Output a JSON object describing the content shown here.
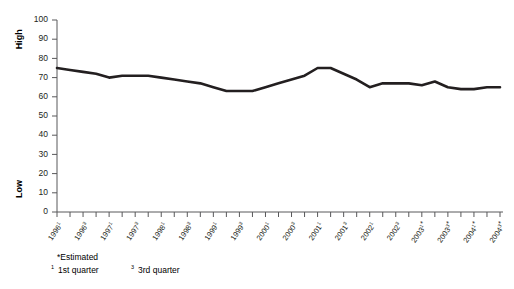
{
  "chart_data": {
    "type": "line",
    "title": "",
    "xlabel": "",
    "ylabel": "",
    "ylim": [
      0,
      100
    ],
    "ytick_step": 10,
    "grid": false,
    "legend": "none",
    "y_axis_annotations": [
      {
        "text": "High",
        "value": 90
      },
      {
        "text": "Low",
        "value": 12
      }
    ],
    "ytick_labels": [
      "100",
      "90",
      "80",
      "70",
      "60",
      "50",
      "40",
      "30",
      "20",
      "10",
      "0"
    ],
    "ytick_values": [
      100,
      90,
      80,
      70,
      60,
      50,
      40,
      30,
      20,
      10,
      0
    ],
    "categories": [
      "1996¹",
      "1996²",
      "1996³",
      "1996⁴",
      "1997¹",
      "1997²",
      "1997³",
      "1997⁴",
      "1998¹",
      "1998²",
      "1998³",
      "1998⁴",
      "1999¹",
      "1999²",
      "1999³",
      "1999⁴",
      "2000¹",
      "2000²",
      "2000³",
      "2000⁴",
      "2001¹",
      "2001²",
      "2001³",
      "2001⁴",
      "2002¹",
      "2002²",
      "2002³",
      "2002⁴",
      "2003¹*",
      "2003²*",
      "2003³*",
      "2003⁴*",
      "2004¹*",
      "2004²*",
      "2004³*"
    ],
    "xtick_labels": [
      {
        "index": 0,
        "year": "1996",
        "sup": "1",
        "est": ""
      },
      {
        "index": 2,
        "year": "1996",
        "sup": "3",
        "est": ""
      },
      {
        "index": 4,
        "year": "1997",
        "sup": "1",
        "est": ""
      },
      {
        "index": 6,
        "year": "1997",
        "sup": "3",
        "est": ""
      },
      {
        "index": 8,
        "year": "1998",
        "sup": "1",
        "est": ""
      },
      {
        "index": 10,
        "year": "1998",
        "sup": "3",
        "est": ""
      },
      {
        "index": 12,
        "year": "1999",
        "sup": "1",
        "est": ""
      },
      {
        "index": 14,
        "year": "1999",
        "sup": "3",
        "est": ""
      },
      {
        "index": 16,
        "year": "2000",
        "sup": "1",
        "est": ""
      },
      {
        "index": 18,
        "year": "2000",
        "sup": "3",
        "est": ""
      },
      {
        "index": 20,
        "year": "2001",
        "sup": "1",
        "est": ""
      },
      {
        "index": 22,
        "year": "2001",
        "sup": "3",
        "est": ""
      },
      {
        "index": 24,
        "year": "2002",
        "sup": "1",
        "est": ""
      },
      {
        "index": 26,
        "year": "2002",
        "sup": "3",
        "est": ""
      },
      {
        "index": 28,
        "year": "2003",
        "sup": "1",
        "est": "*"
      },
      {
        "index": 30,
        "year": "2003",
        "sup": "3",
        "est": "*"
      },
      {
        "index": 32,
        "year": "2004",
        "sup": "1",
        "est": "*"
      },
      {
        "index": 34,
        "year": "2004",
        "sup": "3",
        "est": "*"
      }
    ],
    "values": [
      75,
      74,
      73,
      72,
      70,
      71,
      71,
      71,
      70,
      69,
      68,
      67,
      65,
      63,
      63,
      63,
      65,
      67,
      69,
      71,
      75,
      75,
      72,
      69,
      65,
      67,
      67,
      67,
      66,
      68,
      65,
      64,
      64,
      65,
      65
    ]
  },
  "footnotes": {
    "estimated": "*Estimated",
    "q1_sup": "1",
    "q1": "1st quarter",
    "q3_sup": "3",
    "q3": "3rd quarter"
  },
  "colors": {
    "line": "#231f20",
    "axis": "#58585a",
    "background": "#ffffff"
  }
}
